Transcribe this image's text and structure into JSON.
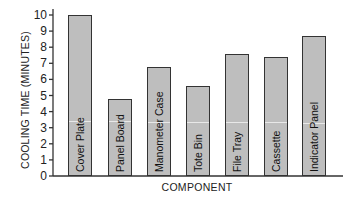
{
  "chart_data": {
    "type": "bar",
    "title": "",
    "xlabel": "COMPONENT",
    "ylabel": "COOLING TIME (MINUTES)",
    "categories": [
      "Cover Plate",
      "Panel Board",
      "Manometer Case",
      "Tote Bin",
      "File Tray",
      "Cassette",
      "Indicator Panel"
    ],
    "values": [
      10.0,
      4.8,
      6.8,
      5.6,
      7.6,
      7.4,
      8.7
    ],
    "ylim": [
      0,
      10
    ],
    "yticks": [
      0,
      1,
      2,
      3,
      4,
      5,
      6,
      7,
      8,
      9,
      10
    ],
    "grid": false,
    "legend": null,
    "bar_labels_inside": true
  },
  "colors": {
    "bar_fill": "#bebebe",
    "bar_outline": "#333333",
    "axis": "#333333"
  }
}
